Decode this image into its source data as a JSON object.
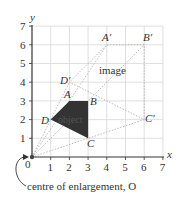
{
  "diagram": {
    "axes": {
      "x_label": "x",
      "y_label": "y",
      "origin_label": "0",
      "x_ticks": [
        "1",
        "2",
        "3",
        "4",
        "5",
        "6",
        "7"
      ],
      "y_ticks": [
        "1",
        "2",
        "3",
        "4",
        "5",
        "6",
        "7"
      ]
    },
    "object": {
      "label": "object",
      "vertices": [
        {
          "name": "A",
          "x": 2,
          "y": 3
        },
        {
          "name": "B",
          "x": 3,
          "y": 3
        },
        {
          "name": "C",
          "x": 3,
          "y": 1
        },
        {
          "name": "D",
          "x": 1,
          "y": 2
        }
      ],
      "fill": "#333333"
    },
    "image": {
      "label": "image",
      "vertices": [
        {
          "name": "A′",
          "x": 4,
          "y": 6
        },
        {
          "name": "B′",
          "x": 6,
          "y": 6
        },
        {
          "name": "C′",
          "x": 6,
          "y": 2
        },
        {
          "name": "D′",
          "x": 2,
          "y": 4
        }
      ]
    },
    "centre_caption": "centre of enlargement, O"
  }
}
